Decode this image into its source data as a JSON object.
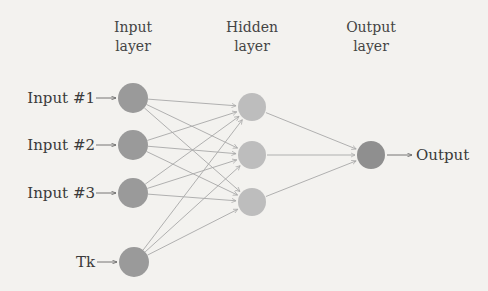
{
  "headers": [
    {
      "line1": "Input",
      "line2": "layer",
      "cx": 133
    },
    {
      "line1": "Hidden",
      "line2": "layer",
      "cx": 252
    },
    {
      "line1": "Output",
      "line2": "layer",
      "cx": 371
    }
  ],
  "input_labels": [
    "Input #1",
    "Input #2",
    "Input #3",
    "Tk"
  ],
  "output_label": "Output",
  "colors": {
    "input_node": "#9a9a9a",
    "hidden_node": "#bdbdbd",
    "output_node": "#8f8f8f",
    "edge": "#a8a8a8",
    "background": "#f3f2ef"
  },
  "nodes": {
    "input": [
      [
        133,
        98
      ],
      [
        133,
        145
      ],
      [
        133,
        193
      ],
      [
        134,
        262
      ]
    ],
    "hidden": [
      [
        252,
        107
      ],
      [
        252,
        155
      ],
      [
        252,
        202
      ]
    ],
    "output": [
      [
        371,
        155
      ]
    ]
  }
}
